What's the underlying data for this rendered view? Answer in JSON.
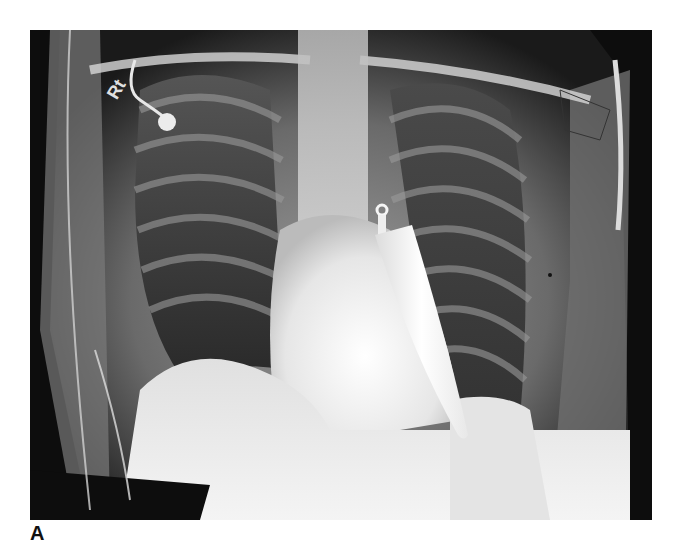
{
  "figure": {
    "panel_label": "A",
    "image": {
      "modality": "chest radiograph",
      "view": "AP",
      "description": "Frontal chest X-ray showing a radiopaque knife blade projecting over the left hemithorax/cardiac silhouette, with ECG lead wires and an electrode on the right upper chest",
      "marker_text": "Rt",
      "findings": [
        "knife blade overlying left heart border",
        "ECG electrode and lead wires",
        "lines over left shoulder"
      ]
    },
    "colors": {
      "background": "#ffffff",
      "frame_dark": "#0d0d0d",
      "bone_bright": "#f2f2f2",
      "lung_dark": "#2a2a2a",
      "knife": "#f7f7f7",
      "label": "#111111"
    }
  }
}
